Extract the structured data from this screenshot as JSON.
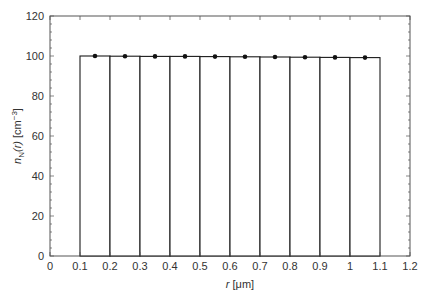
{
  "chart_data": {
    "type": "bar",
    "title": "",
    "xlabel": "r [μm]",
    "xlabel_var": "r",
    "xlabel_unit": " [μm]",
    "ylabel": "n_N(r) [cm^-3]",
    "ylabel_parts": {
      "var": "n",
      "sub": "N",
      "arg": "(r)",
      "unit": " [cm",
      "exp": "−3",
      "close": "]"
    },
    "xlim": [
      0,
      1.2
    ],
    "ylim": [
      0,
      120
    ],
    "xticks": [
      0,
      0.1,
      0.2,
      0.3,
      0.4,
      0.5,
      0.6,
      0.7,
      0.8,
      0.9,
      1,
      1.1,
      1.2
    ],
    "xtick_labels": [
      "0",
      "0.1",
      "0.2",
      "0.3",
      "0.4",
      "0.5",
      "0.6",
      "0.7",
      "0.8",
      "0.9",
      "1",
      "1.1",
      "1.2"
    ],
    "yticks": [
      0,
      20,
      40,
      60,
      80,
      100,
      120
    ],
    "ytick_labels": [
      "0",
      "20",
      "40",
      "60",
      "80",
      "100",
      "120"
    ],
    "grid": false,
    "bins": [
      {
        "left": 0.1,
        "right": 0.2,
        "height": 100.0
      },
      {
        "left": 0.2,
        "right": 0.3,
        "height": 99.9
      },
      {
        "left": 0.3,
        "right": 0.4,
        "height": 99.8
      },
      {
        "left": 0.4,
        "right": 0.5,
        "height": 99.8
      },
      {
        "left": 0.5,
        "right": 0.6,
        "height": 99.7
      },
      {
        "left": 0.6,
        "right": 0.7,
        "height": 99.6
      },
      {
        "left": 0.7,
        "right": 0.8,
        "height": 99.5
      },
      {
        "left": 0.8,
        "right": 0.9,
        "height": 99.4
      },
      {
        "left": 0.9,
        "right": 1.0,
        "height": 99.3
      },
      {
        "left": 1.0,
        "right": 1.1,
        "height": 99.2
      }
    ],
    "points": {
      "x": [
        0.15,
        0.25,
        0.35,
        0.45,
        0.55,
        0.65,
        0.75,
        0.85,
        0.95,
        1.05
      ],
      "y": [
        100.0,
        99.9,
        99.8,
        99.8,
        99.7,
        99.6,
        99.5,
        99.4,
        99.3,
        99.2
      ]
    },
    "colors": {
      "bar_edge": "#1a1a1a",
      "bar_fill": "#ffffff",
      "point": "#111111",
      "axis": "#555555",
      "text": "#333333"
    }
  }
}
